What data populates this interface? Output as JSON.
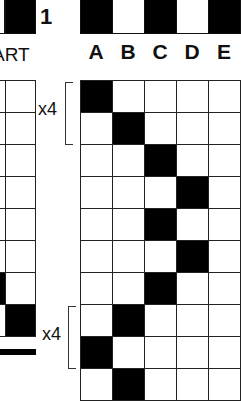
{
  "left_panel": {
    "number_label": "1",
    "chart_label": "ART",
    "top_strip": [
      "white",
      "black"
    ],
    "grid_rows": [
      [
        "white",
        "white"
      ],
      [
        "white",
        "white"
      ],
      [
        "white",
        "white"
      ],
      [
        "white",
        "white"
      ],
      [
        "white",
        "white"
      ],
      [
        "white",
        "white"
      ],
      [
        "black",
        "white"
      ],
      [
        "white",
        "black"
      ]
    ]
  },
  "right_panel": {
    "column_labels": [
      "A",
      "B",
      "C",
      "D",
      "E"
    ],
    "top_strip": [
      "black",
      "white",
      "black",
      "white",
      "black"
    ],
    "grid_rows": [
      [
        "black",
        "white",
        "white",
        "white",
        "white"
      ],
      [
        "white",
        "black",
        "white",
        "white",
        "white"
      ],
      [
        "white",
        "white",
        "black",
        "white",
        "white"
      ],
      [
        "white",
        "white",
        "white",
        "black",
        "white"
      ],
      [
        "white",
        "white",
        "black",
        "white",
        "white"
      ],
      [
        "white",
        "white",
        "white",
        "black",
        "white"
      ],
      [
        "white",
        "white",
        "black",
        "white",
        "white"
      ],
      [
        "white",
        "black",
        "white",
        "white",
        "white"
      ],
      [
        "black",
        "white",
        "white",
        "white",
        "white"
      ],
      [
        "white",
        "black",
        "white",
        "white",
        "white"
      ]
    ]
  },
  "repeats": [
    {
      "label": "x4"
    },
    {
      "label": "x4"
    }
  ],
  "colors": {
    "filled": "#000000",
    "empty": "#ffffff",
    "line": "#222222"
  }
}
